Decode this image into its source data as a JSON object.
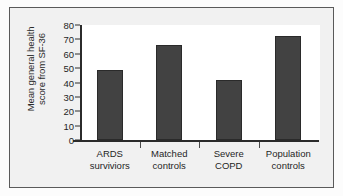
{
  "figure": {
    "background_color": "#f1f1f1",
    "border_color": "#5a5a5a",
    "plot_background_color": "#ffffff"
  },
  "chart_data": {
    "type": "bar",
    "title": "",
    "subtitle": "",
    "xlabel": "",
    "ylabel": "Mean general health score from SF-36",
    "ylabel_line1": "Mean general health",
    "ylabel_line2": "score from SF-36",
    "categories": [
      "ARDS surviviors",
      "Matched controls",
      "Severe COPD",
      "Population controls"
    ],
    "category_lines": [
      [
        "ARDS",
        "surviviors"
      ],
      [
        "Matched",
        "controls"
      ],
      [
        "Severe",
        "COPD"
      ],
      [
        "Population",
        "controls"
      ]
    ],
    "values": [
      49,
      66,
      42,
      72.5
    ],
    "ylim": [
      0,
      80
    ],
    "ytick_labels": [
      "0",
      "10",
      "20",
      "30",
      "40",
      "50",
      "60",
      "70",
      "80"
    ],
    "ytick_values": [
      0,
      10,
      20,
      30,
      40,
      50,
      60,
      70,
      80
    ],
    "grid": false,
    "legend": null,
    "legend_position": "none",
    "bar_color": "#424242",
    "bar_edge_color": "#2a2a2a",
    "axis_color": "#2b2b2b"
  }
}
